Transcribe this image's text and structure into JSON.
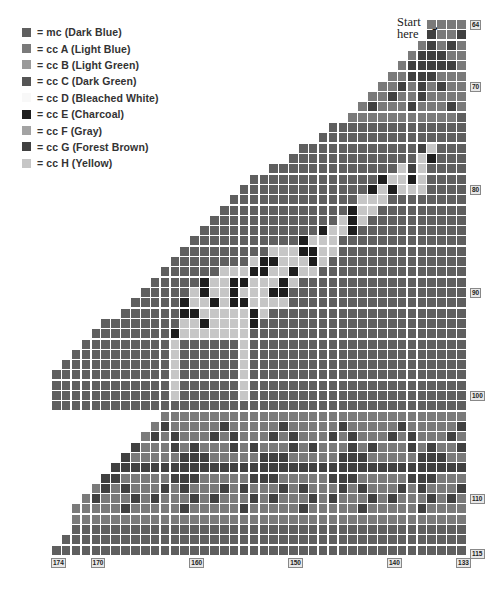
{
  "legend": {
    "items": [
      {
        "key": "M",
        "label": "= mc (Dark Blue)",
        "color": "#5f5f5f"
      },
      {
        "key": "A",
        "label": "= cc A (Light Blue)",
        "color": "#7a7a7a"
      },
      {
        "key": "B",
        "label": "= cc B (Light Green)",
        "color": "#9a9a9a"
      },
      {
        "key": "C",
        "label": "= cc C (Dark Green)",
        "color": "#555555"
      },
      {
        "key": "D",
        "label": "= cc D (Bleached White)",
        "color": "#f8f8f8"
      },
      {
        "key": "E",
        "label": "= cc E (Charcoal)",
        "color": "#1e1e1e"
      },
      {
        "key": "F",
        "label": "= cc F (Gray)",
        "color": "#a3a3a3"
      },
      {
        "key": "G",
        "label": "= cc G (Forest Brown)",
        "color": "#404040"
      },
      {
        "key": "H",
        "label": "= cc H (Yellow)",
        "color": "#c6c6c6"
      }
    ]
  },
  "annotation": {
    "start_line1": "Start",
    "start_line2": "here",
    "arrow": "➤"
  },
  "chart_data": {
    "type": "table",
    "first_row": 64,
    "last_row": 115,
    "first_col": 174,
    "last_col": 133,
    "row_labels": [
      {
        "row": 64,
        "label": "64"
      },
      {
        "row": 70,
        "label": "70"
      },
      {
        "row": 80,
        "label": "80"
      },
      {
        "row": 90,
        "label": "90"
      },
      {
        "row": 100,
        "label": "100"
      },
      {
        "row": 110,
        "label": "110"
      },
      {
        "row": 115,
        "label": "115"
      }
    ],
    "col_labels": [
      {
        "col": 174,
        "label": "174"
      },
      {
        "col": 170,
        "label": "170"
      },
      {
        "col": 160,
        "label": "160"
      },
      {
        "col": 150,
        "label": "150"
      },
      {
        "col": 140,
        "label": "140"
      },
      {
        "col": 133,
        "label": "133"
      }
    ],
    "grid_note": "Row strings read left (col 174) to right (col 133); '.' = no stitch",
    "rows": [
      "......................................AAAA",
      ".....................................GAAG",
      "....................................AGAGA",
      "...................................AGGGAA",
      "..................................AGGGGGA",
      ".................................AAGGGAAA",
      "................................AAGAGAGAA",
      "...............................AAGAAGAAAA",
      "..............................AGAAAGAAAGA",
      ".............................AAAAAAAAAAAM",
      "............................MMMMMMMMMMMMMM",
      "...........................MMMMMMMMMMMMMMM",
      "..........................MMMMMMMMMMMMGHMMM",
      ".........................MMMMMMMMMMMMMHEMMM",
      "........................MMMMMMMMMMMMMHGHMMMM",
      ".......................MMMMMMMMMMMMMEHHEHMMMM",
      "......................MMMMMMMMMMMMMEHEHHHMMMM",
      ".....................MMMMMMMMMMMMMHHHMMMMMMMM",
      "....................MMMMMMMMMMMMMEHHMMMMMMMMM",
      "...................MMMMMMMMMMMMMHEHMMMMMMMMMM",
      "..................MMMMMMMMMMMMEHHEMMMMMMMMMMM",
      ".................MMMMMMMMMMMEHHHMMMMMMMMMMMMM",
      "................MMMMMMMMMHHHEEHHMMMMMMMMMMMMM",
      "...............MMMMMMMMHEEHHHEHMMMMMMMMMMMMMM",
      "..............MMMMMMHHHEEHHEHHMMMMMMMMMMMMMMM",
      ".............MMMMMEHHEEHHHEHMMMMMMMMMMMMMMMMM",
      "............MMMMMHEHHEHHHEEMMMMMMMMMMMMMMMMMM",
      "...........MMMMMEHHEHEEHHHHMMMMMMMMMMMMMMMMMM",
      "..........MMMMMMEEHHHHHEHMMMMMMMMMMMMMMMMMMMM",
      ".........MMMMMMMMHHEHHHHEMMMMMMMMMMMMMMMMMMMMM",
      "........MMMMMMMMEHHHHHHHMMMMMMMMMMMMMMMMMMMMMM",
      ".......MMMMMMMMMHMMMMMMHMMMMMMMMMMMMMMMMMMMMMM",
      "......MMMMMMMMMMHMMMMMMHMMMMMMMMMMMMMMMMMMMMMM",
      ".....MMMMMMMMMMMHMMMMMMHMMMMMMMMMMMMMMMMMMMMMM",
      "....MMMMMMMMMMMMHMMMMMMHMMMMMMMMMMMMMMMMMMMMMM",
      "...MMMMMMMMMMMMMHMMMMMMHMMMMMMMMMMMMMMMMMMMMMM",
      "..MMMMMMMMMMMMMMHMMMMMMHMMMMMMMMMMMMMMMMMMMMMM",
      ".MMMMMMMMMMMMMMMMMMMMMMMMMMMMMMMMMMMMMMMMMMM",
      "...........AAAAAAAAAAAAAAAAAAAAAAAAAAAAAAA",
      "..........AGAAAAAGAAAAAGAAAAAGAAAAAGAAAAAG",
      ".........AGAGAAAGAGAAAGAGAAAGAGAAAGAGAAAGA",
      "........GAAAGAGAAAGAGAAAGAGAAAGAGAAAGAGAAG",
      ".......GAAAAAGGGAAAAAGGGAAAAAGGGAAAAAGGGAA",
      "......GGGGGGGGGGGGGGGGGGGGGGGGGGGGGGGGGGGG",
      ".....GGAAAAAGGGAAAAAGGGAAAAAGGGAAAAAGGGAAA",
      "....AGAGAAAGAGAAAGAGAAAGAGAAAGAGAAAGAGAAAG",
      "...AGAAAGAGAAAGAGAAAGAGAAAGAGAAAGAGAAAGAGA",
      "..AAAAAGAAAAAGAAAAAGAAAAAGAAAAAGAAAAAGAAAA",
      "..AAAAAAAAAAAAAAAAAAAAAAAAAAAAAAAAAAAAAAAA",
      "..MMMMMMMMMMMMMMMMMMMMMMMMMMMMMMMMMMMMMMMM",
      ".MMMMMMMMMMMMMMMMMMMMMMMMMMMMMMMMMMMMMMMMM",
      "MMMMMMMMMMMMMMMMMMMMMMMMMMMMMMMMMMMMMMMMMM"
    ]
  }
}
